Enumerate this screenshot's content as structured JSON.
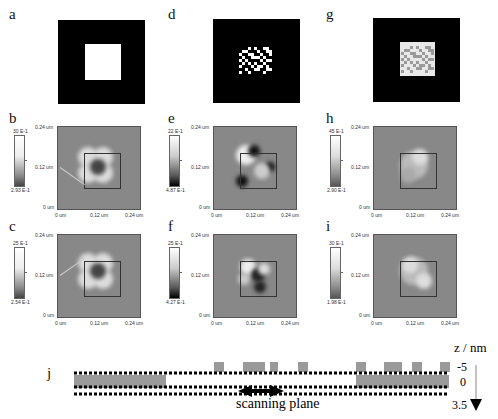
{
  "panels": {
    "a": "a",
    "b": "b",
    "c": "c",
    "d": "d",
    "e": "e",
    "f": "f",
    "g": "g",
    "h": "h",
    "i": "i",
    "j": "j"
  },
  "axis_ticks": {
    "y_top": "0.24 um",
    "y_mid": "0.12 um",
    "y_bottom": "0 um",
    "x_left": "0 um",
    "x_mid": "0.12 um",
    "x_right": "0.24 um"
  },
  "colorbars": {
    "b": {
      "max": "30 E-1",
      "min": "2.93 E-1"
    },
    "c": {
      "max": "25 E-1",
      "min": "2.54 E-1"
    },
    "e": {
      "max": "22 E-1",
      "min": "4.87 E-1"
    },
    "f": {
      "max": "25 E-1",
      "min": "4.27 E-1"
    },
    "h": {
      "max": "45 E-1",
      "min": "2.90 E-1"
    },
    "i": {
      "max": "30 E-1",
      "min": "1.98 E-1"
    }
  },
  "schematic": {
    "z_axis_label": "z / nm",
    "z_ticks": [
      "-5",
      "0",
      "3.5"
    ],
    "scan_label": "scanning plane"
  },
  "colors": {
    "mask_black": "#000000",
    "mask_white": "#ffffff",
    "mask_gray": "#9a9a9a",
    "afm_background": "#888888",
    "schematic_block": "#9a9a9a"
  }
}
